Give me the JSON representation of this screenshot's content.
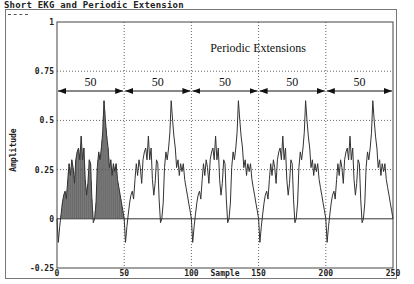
{
  "window": {
    "title": "Short EKG and Periodic Extension"
  },
  "chart_data": {
    "type": "line",
    "title": "Short EKG and Periodic Extension",
    "xlabel": "Sample",
    "ylabel": "Amplitude",
    "xlim": [
      0,
      250
    ],
    "ylim": [
      -0.25,
      1
    ],
    "x_ticks": [
      0,
      50,
      100,
      150,
      200,
      250
    ],
    "y_ticks": [
      -0.25,
      0,
      0.25,
      0.5,
      0.75,
      1
    ],
    "y_tick_labels": [
      "-0.25",
      "0",
      "0.25",
      "0.5",
      "0.75",
      "1"
    ],
    "grid": "dotted vertical at 50,100,150,200; dotted horizontal at 0.25,0.5,0.75",
    "annotation": "Periodic Extensions",
    "period_labels": [
      "50",
      "50",
      "50",
      "50",
      "50"
    ],
    "period": 50,
    "filled_segment": [
      0,
      50
    ],
    "series": [
      {
        "name": "Short EKG (one period, repeated 5 times)",
        "x": [
          0,
          1,
          2,
          3,
          4,
          5,
          6,
          7,
          8,
          9,
          10,
          11,
          12,
          13,
          14,
          15,
          16,
          17,
          18,
          19,
          20,
          21,
          22,
          23,
          24,
          25,
          26,
          27,
          28,
          29,
          30,
          31,
          32,
          33,
          34,
          35,
          36,
          37,
          38,
          39,
          40,
          41,
          42,
          43,
          44,
          45,
          46,
          47,
          48,
          49,
          50
        ],
        "values": [
          0.0,
          -0.12,
          -0.04,
          0.02,
          0.08,
          0.12,
          0.14,
          0.1,
          0.2,
          0.28,
          0.22,
          0.3,
          0.26,
          0.18,
          0.3,
          0.34,
          0.36,
          0.3,
          0.42,
          0.3,
          0.36,
          0.2,
          0.12,
          0.18,
          0.3,
          0.28,
          0.1,
          -0.02,
          0.0,
          0.08,
          0.26,
          0.34,
          0.3,
          0.36,
          0.44,
          0.6,
          0.5,
          0.42,
          0.36,
          0.26,
          0.3,
          0.22,
          0.28,
          0.24,
          0.28,
          0.2,
          0.16,
          0.12,
          0.08,
          0.04,
          0.0
        ]
      }
    ]
  }
}
